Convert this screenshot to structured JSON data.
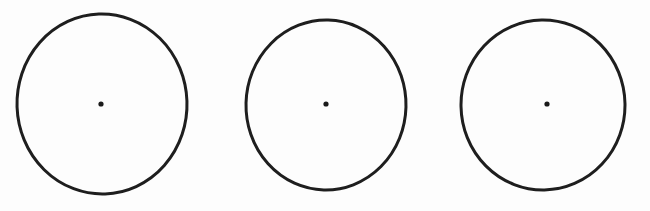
{
  "figure": {
    "background_color": "#fdfdfd",
    "width": 650,
    "height": 211,
    "stroke_color": "#1e1e1e",
    "dot_color": "#1a1a1a",
    "shapes": [
      {
        "name": "circle-1",
        "label": "Circle 1",
        "cx": 102,
        "cy": 104,
        "rx": 85,
        "ry": 90,
        "rotation": -2,
        "stroke_width": 3.0,
        "dot_radius": 2.6,
        "dot_cx": 101,
        "dot_cy": 104
      },
      {
        "name": "circle-2",
        "label": "Circle 2",
        "cx": 326,
        "cy": 105,
        "rx": 80,
        "ry": 85,
        "rotation": 1.5,
        "stroke_width": 3.0,
        "dot_radius": 2.6,
        "dot_cx": 326,
        "dot_cy": 104
      },
      {
        "name": "circle-3",
        "label": "Circle 3",
        "cx": 543,
        "cy": 105,
        "rx": 82,
        "ry": 85,
        "rotation": -1,
        "stroke_width": 3.0,
        "dot_radius": 2.6,
        "dot_cx": 547,
        "dot_cy": 104
      }
    ]
  },
  "chart_data": {
    "type": "scatter",
    "title": "",
    "xlabel": "",
    "ylabel": "",
    "legend": [],
    "annotations": [],
    "grid": false,
    "series": [
      {
        "name": "circle-centers",
        "x": [
          101,
          326,
          547
        ],
        "y": [
          104,
          104,
          104
        ]
      }
    ],
    "shapes": [
      {
        "type": "ellipse",
        "cx": 102,
        "cy": 104,
        "rx": 85,
        "ry": 90
      },
      {
        "type": "ellipse",
        "cx": 326,
        "cy": 105,
        "rx": 80,
        "ry": 85
      },
      {
        "type": "ellipse",
        "cx": 543,
        "cy": 105,
        "rx": 82,
        "ry": 85
      }
    ]
  }
}
